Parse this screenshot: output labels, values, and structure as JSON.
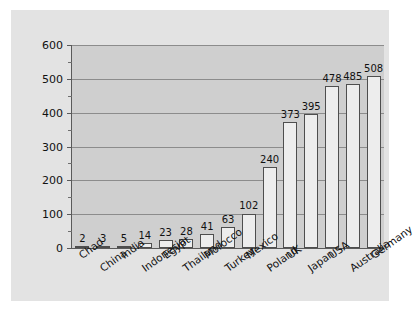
{
  "chart_data": {
    "type": "bar",
    "title": "",
    "subtitle": "",
    "xlabel": "",
    "ylabel": "",
    "ylim": [
      0,
      600
    ],
    "yticks": [
      0,
      100,
      200,
      300,
      400,
      500,
      600
    ],
    "ytick_labels": [
      "0",
      "100",
      "200",
      "300",
      "400",
      "500",
      "600"
    ],
    "yminor_ticks": [
      50,
      150,
      250,
      350,
      450,
      550
    ],
    "grid": true,
    "grid_axis": "y",
    "legend": false,
    "legend_position": "none",
    "categories": [
      "Chad",
      "China",
      "India",
      "Indonesia",
      "Egypt",
      "Thailand",
      "Morocco",
      "Turkey",
      "Mexico",
      "Poland",
      "UK",
      "Japan",
      "USA",
      "Australia",
      "Germany"
    ],
    "values": [
      2,
      3,
      5,
      14,
      23,
      28,
      41,
      63,
      102,
      240,
      373,
      395,
      478,
      485,
      508
    ],
    "data_labels": [
      "2",
      "3",
      "5",
      "14",
      "23",
      "28",
      "41",
      "63",
      "102",
      "240",
      "373",
      "395",
      "478",
      "485",
      "508"
    ],
    "bar_fill_color": "#ededed",
    "bar_edge_color": "#4e4e4e",
    "plot_background_color": "#cfcfcf",
    "panel_background_color": "#e3e3e3",
    "figure_background_color": "#ffffff",
    "gridline_color": "#8c8c8c",
    "axis_color": "#5a5a5a",
    "text_color": "#111111",
    "label_rotation_degrees": -36
  }
}
